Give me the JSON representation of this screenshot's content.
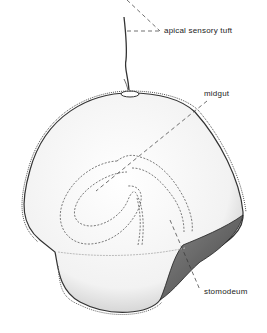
{
  "diagram": {
    "labels": {
      "apical_sensory_tuft": "apical sensory tuft",
      "midgut": "midgut",
      "stomodeum": "stomodeum"
    }
  }
}
